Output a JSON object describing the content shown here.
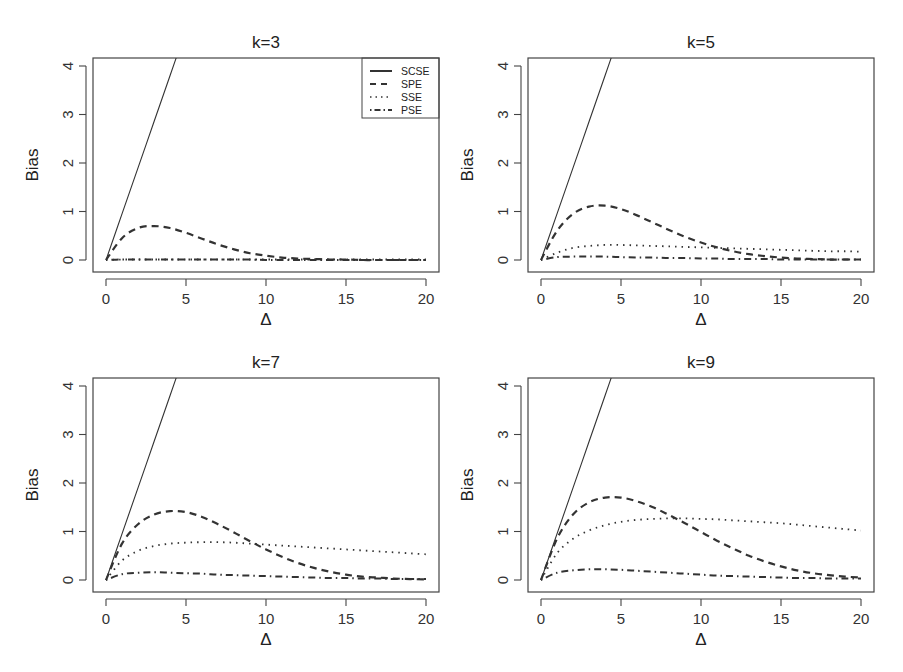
{
  "figure": {
    "ylabel": "Bias",
    "xlabel": "Δ",
    "x_ticks": [
      "0",
      "5",
      "10",
      "15",
      "20"
    ],
    "y_ticks": [
      "0",
      "1",
      "2",
      "3",
      "4"
    ],
    "legend": [
      {
        "label": "SCSE",
        "style": "solid"
      },
      {
        "label": "SPE",
        "style": "dashed"
      },
      {
        "label": "SSE",
        "style": "dotted"
      },
      {
        "label": "PSE",
        "style": "dotdash"
      }
    ],
    "line_color": "#333333"
  },
  "chart_data": [
    {
      "type": "line",
      "title": "k=3",
      "xlabel": "Δ",
      "ylabel": "Bias",
      "xlim": [
        0,
        20
      ],
      "ylim": [
        0,
        4
      ],
      "legend_position": "top-right",
      "x": [
        0,
        1,
        2,
        3,
        4,
        5,
        6,
        7,
        8,
        9,
        10,
        11,
        12,
        13,
        14,
        15,
        16,
        17,
        18,
        19,
        20
      ],
      "series": [
        {
          "name": "SCSE",
          "style": "solid",
          "values": [
            0,
            0.95,
            1.9,
            2.85,
            3.8,
            4.75,
            null,
            null,
            null,
            null,
            null,
            null,
            null,
            null,
            null,
            null,
            null,
            null,
            null,
            null,
            null
          ]
        },
        {
          "name": "SPE",
          "style": "dashed",
          "values": [
            0,
            0.45,
            0.66,
            0.7,
            0.66,
            0.56,
            0.44,
            0.32,
            0.22,
            0.14,
            0.09,
            0.05,
            0.03,
            0.02,
            0.01,
            0.01,
            0,
            0,
            0,
            0,
            0
          ]
        },
        {
          "name": "SSE",
          "style": "dotted",
          "values": [
            0,
            0.01,
            0.01,
            0.01,
            0.01,
            0.01,
            0.01,
            0.01,
            0.01,
            0.01,
            0.01,
            0.01,
            0.01,
            0.01,
            0.01,
            0.01,
            0.01,
            0.01,
            0.01,
            0.01,
            0.01
          ]
        },
        {
          "name": "PSE",
          "style": "dotdash",
          "values": [
            0,
            0.01,
            0.01,
            0.01,
            0.01,
            0.01,
            0.01,
            0.01,
            0.01,
            0.01,
            0,
            0,
            0,
            0,
            0,
            0,
            0,
            0,
            0,
            0,
            0
          ]
        }
      ]
    },
    {
      "type": "line",
      "title": "k=5",
      "xlabel": "Δ",
      "ylabel": "Bias",
      "xlim": [
        0,
        20
      ],
      "ylim": [
        0,
        4
      ],
      "x": [
        0,
        1,
        2,
        3,
        4,
        5,
        6,
        7,
        8,
        9,
        10,
        11,
        12,
        13,
        14,
        15,
        16,
        17,
        18,
        19,
        20
      ],
      "series": [
        {
          "name": "SCSE",
          "style": "solid",
          "values": [
            0,
            0.95,
            1.9,
            2.85,
            3.8,
            4.75,
            null,
            null,
            null,
            null,
            null,
            null,
            null,
            null,
            null,
            null,
            null,
            null,
            null,
            null,
            null
          ]
        },
        {
          "name": "SPE",
          "style": "dashed",
          "values": [
            0,
            0.6,
            0.95,
            1.1,
            1.12,
            1.05,
            0.92,
            0.77,
            0.62,
            0.48,
            0.36,
            0.26,
            0.18,
            0.12,
            0.08,
            0.05,
            0.03,
            0.02,
            0.01,
            0.01,
            0.01
          ]
        },
        {
          "name": "SSE",
          "style": "dotted",
          "values": [
            0,
            0.15,
            0.25,
            0.29,
            0.31,
            0.31,
            0.3,
            0.29,
            0.28,
            0.27,
            0.26,
            0.25,
            0.24,
            0.23,
            0.22,
            0.21,
            0.2,
            0.19,
            0.18,
            0.18,
            0.17
          ]
        },
        {
          "name": "PSE",
          "style": "dotdash",
          "values": [
            0,
            0.06,
            0.07,
            0.07,
            0.07,
            0.06,
            0.05,
            0.05,
            0.04,
            0.04,
            0.03,
            0.03,
            0.02,
            0.02,
            0.02,
            0.01,
            0.01,
            0.01,
            0.01,
            0.01,
            0.01
          ]
        }
      ]
    },
    {
      "type": "line",
      "title": "k=7",
      "xlabel": "Δ",
      "ylabel": "Bias",
      "xlim": [
        0,
        20
      ],
      "ylim": [
        0,
        4
      ],
      "x": [
        0,
        1,
        2,
        3,
        4,
        5,
        6,
        7,
        8,
        9,
        10,
        11,
        12,
        13,
        14,
        15,
        16,
        17,
        18,
        19,
        20
      ],
      "series": [
        {
          "name": "SCSE",
          "style": "solid",
          "values": [
            0,
            0.95,
            1.9,
            2.85,
            3.8,
            4.75,
            null,
            null,
            null,
            null,
            null,
            null,
            null,
            null,
            null,
            null,
            null,
            null,
            null,
            null,
            null
          ]
        },
        {
          "name": "SPE",
          "style": "dashed",
          "values": [
            0,
            0.75,
            1.15,
            1.35,
            1.42,
            1.4,
            1.3,
            1.15,
            0.98,
            0.8,
            0.63,
            0.48,
            0.35,
            0.25,
            0.17,
            0.11,
            0.07,
            0.05,
            0.03,
            0.02,
            0.01
          ]
        },
        {
          "name": "SSE",
          "style": "dotted",
          "values": [
            0,
            0.4,
            0.6,
            0.7,
            0.75,
            0.77,
            0.78,
            0.78,
            0.77,
            0.75,
            0.73,
            0.71,
            0.69,
            0.67,
            0.65,
            0.63,
            0.61,
            0.59,
            0.57,
            0.55,
            0.53
          ]
        },
        {
          "name": "PSE",
          "style": "dotdash",
          "values": [
            0,
            0.12,
            0.15,
            0.16,
            0.15,
            0.14,
            0.13,
            0.11,
            0.1,
            0.09,
            0.08,
            0.07,
            0.06,
            0.05,
            0.04,
            0.04,
            0.03,
            0.03,
            0.02,
            0.02,
            0.02
          ]
        }
      ]
    },
    {
      "type": "line",
      "title": "k=9",
      "xlabel": "Δ",
      "ylabel": "Bias",
      "xlim": [
        0,
        20
      ],
      "ylim": [
        0,
        4
      ],
      "x": [
        0,
        1,
        2,
        3,
        4,
        5,
        6,
        7,
        8,
        9,
        10,
        11,
        12,
        13,
        14,
        15,
        16,
        17,
        18,
        19,
        20
      ],
      "series": [
        {
          "name": "SCSE",
          "style": "solid",
          "values": [
            0,
            0.95,
            1.9,
            2.85,
            3.8,
            4.75,
            null,
            null,
            null,
            null,
            null,
            null,
            null,
            null,
            null,
            null,
            null,
            null,
            null,
            null,
            null
          ]
        },
        {
          "name": "SPE",
          "style": "dashed",
          "values": [
            0,
            0.85,
            1.35,
            1.6,
            1.7,
            1.7,
            1.62,
            1.5,
            1.34,
            1.17,
            0.99,
            0.81,
            0.65,
            0.5,
            0.38,
            0.28,
            0.2,
            0.14,
            0.1,
            0.07,
            0.05
          ]
        },
        {
          "name": "SSE",
          "style": "dotted",
          "values": [
            0,
            0.55,
            0.85,
            1.02,
            1.13,
            1.2,
            1.24,
            1.26,
            1.27,
            1.27,
            1.26,
            1.25,
            1.23,
            1.21,
            1.19,
            1.17,
            1.14,
            1.11,
            1.08,
            1.05,
            1.02
          ]
        },
        {
          "name": "PSE",
          "style": "dotdash",
          "values": [
            0,
            0.15,
            0.2,
            0.22,
            0.22,
            0.21,
            0.19,
            0.17,
            0.15,
            0.13,
            0.11,
            0.09,
            0.08,
            0.07,
            0.06,
            0.05,
            0.04,
            0.04,
            0.03,
            0.03,
            0.03
          ]
        }
      ]
    }
  ]
}
